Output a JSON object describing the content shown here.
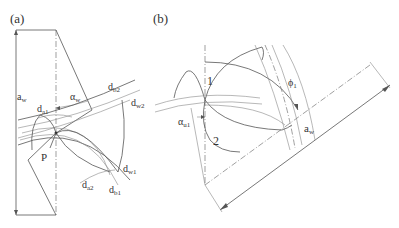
{
  "panels": [
    {
      "id": "a",
      "label": "(a)",
      "annotations": {
        "center_distance": "a",
        "center_distance_sub": "w",
        "pressure_angle": "α",
        "pressure_angle_sub": "w",
        "tip_diameter_1": "d",
        "tip_diameter_1_sub": "a1",
        "base_diameter_2": "d",
        "base_diameter_2_sub": "b2",
        "pitch_diameter_2": "d",
        "pitch_diameter_2_sub": "w2",
        "pitch_point": "P",
        "pitch_diameter_1": "d",
        "pitch_diameter_1_sub": "w1",
        "tip_diameter_2": "d",
        "tip_diameter_2_sub": "a2",
        "base_diameter_1": "d",
        "base_diameter_1_sub": "b1"
      }
    },
    {
      "id": "b",
      "label": "(b)",
      "annotations": {
        "gear_1": "1",
        "gear_2": "2",
        "rotation_angle": "ϕ",
        "rotation_angle_sub": "1",
        "tip_pressure_angle": "α",
        "tip_pressure_angle_sub": "u1",
        "center_distance": "a",
        "center_distance_sub": "w"
      }
    }
  ]
}
